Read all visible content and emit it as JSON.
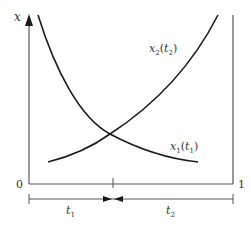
{
  "diagram": {
    "title": "",
    "y_axis_label": "x",
    "x_axis_start_label": "0",
    "x_axis_end_label": "1",
    "curves": [
      {
        "name": "x1(t1)",
        "base": "x",
        "sub": "1",
        "arg": "t",
        "arg_sub": "1",
        "trend": "decreasing"
      },
      {
        "name": "x2(t2)",
        "base": "x",
        "sub": "2",
        "arg": "t",
        "arg_sub": "2",
        "trend": "increasing"
      }
    ],
    "intervals": [
      {
        "label": "t",
        "sub": "1",
        "position": "left"
      },
      {
        "label": "t",
        "sub": "2",
        "position": "right"
      }
    ],
    "colors": {
      "curve": "#1a1a1a",
      "axis": "#555555",
      "text": "#333333",
      "background": "#ffffff"
    }
  }
}
